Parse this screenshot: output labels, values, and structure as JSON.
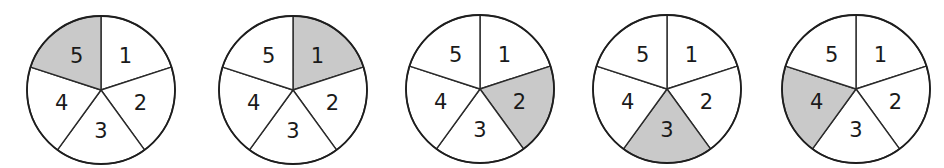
{
  "diagram": {
    "colors": {
      "shaded": "#c9c9c9",
      "unshaded": "#ffffff",
      "stroke": "#2a2a2a"
    },
    "radius": 74,
    "sector_labels": [
      "1",
      "2",
      "3",
      "4",
      "5"
    ],
    "spinners": [
      {
        "cx": 101,
        "cy": 90,
        "shaded": "5"
      },
      {
        "cx": 293,
        "cy": 90,
        "shaded": "1"
      },
      {
        "cx": 480,
        "cy": 89,
        "shaded": "2"
      },
      {
        "cx": 667,
        "cy": 89,
        "shaded": "3"
      },
      {
        "cx": 856,
        "cy": 89,
        "shaded": "4"
      }
    ]
  }
}
